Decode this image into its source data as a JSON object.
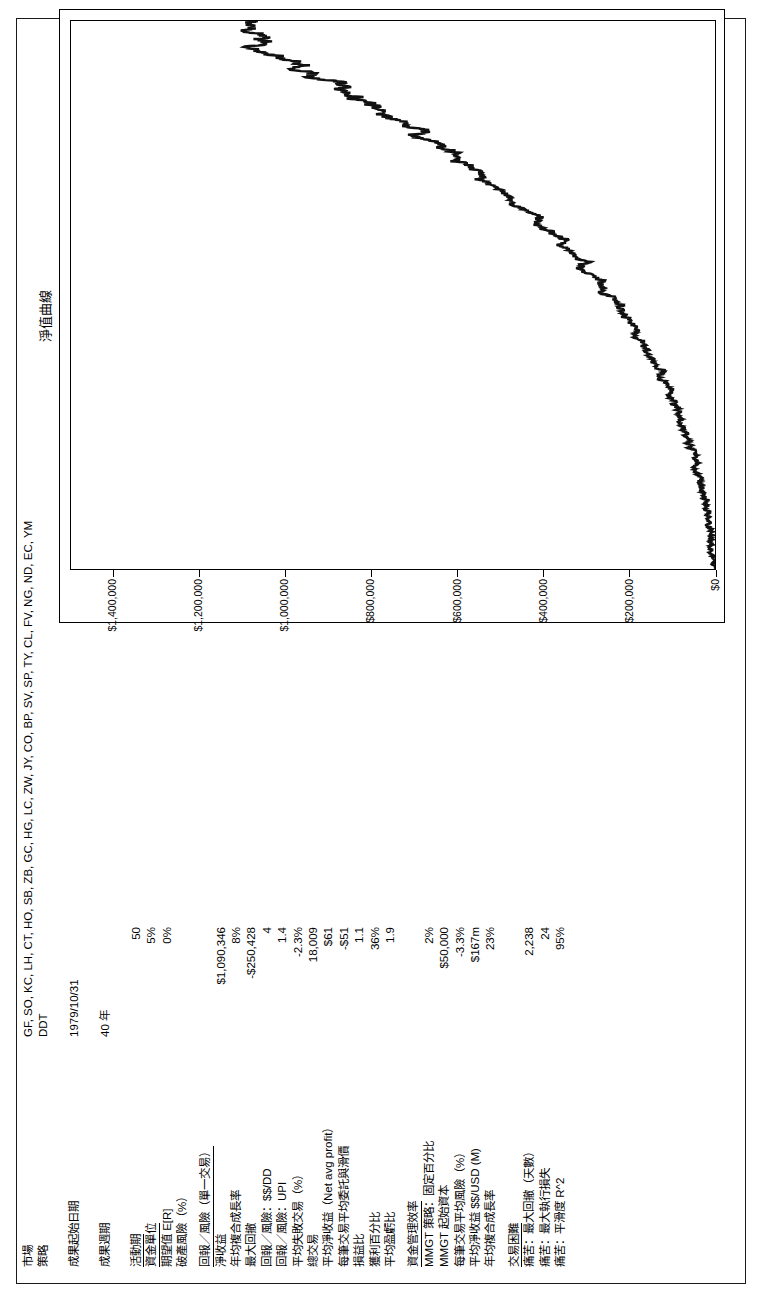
{
  "report": {
    "header_rows": [
      {
        "label": "市場",
        "value": "GF, SO, KC, LH, CT, HO, SB, ZB, GC, HG, LC, ZW, JY, CO, BP, SV, SP, TY, CL, FV, NG, ND, EC, YM"
      },
      {
        "label": "策略",
        "value": "DDT"
      }
    ],
    "date_rows": [
      {
        "label": "成果起始日期",
        "value": "1979/10/31"
      },
      {
        "label": "成果週期",
        "value": "40 年"
      }
    ],
    "risk_rows": [
      {
        "label": "活動期",
        "value": "50"
      },
      {
        "label": "資金單位",
        "value": "5%"
      },
      {
        "label": "期望值 E[R]",
        "value": "0%"
      },
      {
        "label": "破產風險（%）",
        "value": ""
      }
    ],
    "section_return": "回報／風險（單一交易）",
    "return_rows": [
      {
        "label": "淨收益",
        "value": "$1,090,346"
      },
      {
        "label": "年均複合成長率",
        "value": "8%"
      },
      {
        "label": "最大回撤",
        "value": "-$250,428"
      },
      {
        "label": "回報／風險：$$/DD",
        "value": "4"
      },
      {
        "label": "回報／風險：UPI",
        "value": "1.4"
      },
      {
        "label": "平均失敗交易（%）",
        "value": "-2.3%"
      },
      {
        "label": "總交易",
        "value": "18,009"
      },
      {
        "label": "平均淨收益（Net avg profit）",
        "value": "$61"
      },
      {
        "label": "每筆交易平均委託與滑價",
        "value": "-$51"
      },
      {
        "label": "損益比",
        "value": "1.1"
      },
      {
        "label": "獲利百分比",
        "value": "36%"
      },
      {
        "label": "平均盈虧比",
        "value": "1.9"
      }
    ],
    "section_money": "資金管理效率",
    "money_rows": [
      {
        "label": "MMGT 策略：固定百分比",
        "value": "2%"
      },
      {
        "label": "MMGT 起始資本",
        "value": "$50,000"
      },
      {
        "label": "每筆交易平均風險（%）",
        "value": "-3.3%"
      },
      {
        "label": "平均淨收益 $$/USD (M)",
        "value": "$167m"
      },
      {
        "label": "年均複合成長率",
        "value": "23%"
      }
    ],
    "section_difficulty": "交易困難",
    "difficulty_rows": [
      {
        "label": "痛苦：最大回撤（天數）",
        "value": "2,238"
      },
      {
        "label": "痛苦：最大執行損失",
        "value": "24"
      },
      {
        "label": "痛苦：平滑度 R^2",
        "value": "95%"
      }
    ]
  },
  "chart_data": {
    "type": "line",
    "title": "淨值曲線",
    "xlabel": "",
    "ylabel": "",
    "ylim": [
      0,
      1500000
    ],
    "grid": false,
    "legend": "none",
    "ytick_labels": [
      "$1,400,000",
      "$1,200,000",
      "$1,000,000",
      "$800,000",
      "$600,000",
      "$400,000",
      "$200,000",
      "$0"
    ],
    "ytick_values": [
      1400000,
      1200000,
      1000000,
      800000,
      600000,
      400000,
      200000,
      0
    ],
    "series": [
      {
        "name": "淨值曲線",
        "x": [
          0,
          1,
          2,
          3,
          4,
          5,
          6,
          7,
          8,
          9,
          10,
          11,
          12,
          13,
          14,
          15,
          16,
          17,
          18,
          19,
          20,
          21,
          22,
          23,
          24,
          25,
          26,
          27,
          28,
          29,
          30,
          31,
          32,
          33,
          34,
          35,
          36,
          37,
          38,
          39,
          40,
          41,
          42,
          43,
          44,
          45,
          46,
          47,
          48,
          49,
          50,
          51,
          52,
          53,
          54,
          55,
          56,
          57,
          58,
          59,
          60,
          61,
          62,
          63,
          64,
          65,
          66,
          67,
          68,
          69,
          70,
          71,
          72,
          73,
          74,
          75,
          76,
          77,
          78,
          79,
          80,
          81,
          82,
          83,
          84,
          85,
          86,
          87,
          88,
          89,
          90,
          91,
          92,
          93,
          94,
          95,
          96,
          97,
          98,
          99,
          100
        ],
        "values": [
          2000,
          4000,
          5000,
          7000,
          9000,
          11000,
          10000,
          13000,
          16000,
          15000,
          18000,
          22000,
          21000,
          26000,
          30000,
          34000,
          33000,
          38000,
          44000,
          48000,
          46000,
          52000,
          58000,
          63000,
          61000,
          68000,
          75000,
          82000,
          80000,
          88000,
          96000,
          104000,
          101000,
          110000,
          119000,
          128000,
          124000,
          134000,
          145000,
          156000,
          152000,
          163000,
          175000,
          188000,
          183000,
          196000,
          210000,
          224000,
          218000,
          233000,
          249000,
          265000,
          258000,
          275000,
          293000,
          311000,
          303000,
          322000,
          342000,
          362000,
          353000,
          374000,
          396000,
          418000,
          408000,
          431000,
          455000,
          479000,
          468000,
          493000,
          519000,
          546000,
          533000,
          560000,
          589000,
          618000,
          604000,
          634000,
          665000,
          697000,
          681000,
          714000,
          748000,
          783000,
          765000,
          801000,
          838000,
          876000,
          856000,
          895000,
          935000,
          976000,
          954000,
          996000,
          1039000,
          1083000,
          1059000,
          1052000,
          1070000,
          1085000,
          1090346
        ]
      }
    ]
  }
}
